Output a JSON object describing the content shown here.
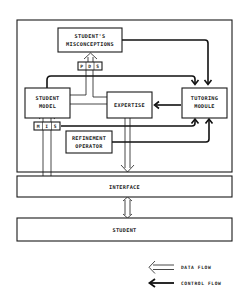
{
  "diagram": {
    "type": "architecture-block-diagram",
    "nodes": {
      "misconceptions": {
        "line1": "STUDENT'S",
        "line2": "MISCONCEPTIONS"
      },
      "pds": {
        "letters": [
          "P",
          "D",
          "S"
        ]
      },
      "student_model": {
        "line1": "STUDENT",
        "line2": "MODEL"
      },
      "expertise": {
        "label": "EXPERTISE"
      },
      "tutoring_module": {
        "line1": "TUTORING",
        "line2": "MODULE"
      },
      "mis": {
        "letters": [
          "M",
          "I",
          "S"
        ]
      },
      "refinement_operator": {
        "line1": "REFINEMENT",
        "line2": "OPERATOR"
      },
      "interface": {
        "label": "INTERFACE"
      },
      "student": {
        "label": "STUDENT"
      }
    },
    "edges": [
      {
        "from": "misconceptions",
        "to": "tutoring_module",
        "kind": "control"
      },
      {
        "from": "student_model",
        "to": "tutoring_module",
        "kind": "control"
      },
      {
        "from": "tutoring_module",
        "to": "expertise",
        "kind": "control"
      },
      {
        "from": "mis",
        "to": "tutoring_module",
        "kind": "control"
      },
      {
        "from": "refinement_operator",
        "to": "tutoring_module",
        "kind": "control"
      },
      {
        "from": "pds",
        "to": "misconceptions",
        "kind": "data"
      },
      {
        "from": "interface",
        "to": "student_model",
        "kind": "data",
        "via": "mis"
      },
      {
        "from": "expertise",
        "to": "interface",
        "kind": "data"
      },
      {
        "from": "interface",
        "to": "student",
        "kind": "data",
        "bidirectional": true
      }
    ]
  },
  "legend": {
    "data_flow": "DATA FLOW",
    "control_flow": "CONTROL FLOW"
  }
}
